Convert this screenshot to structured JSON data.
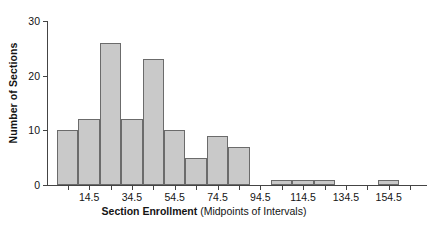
{
  "chart_data": {
    "type": "bar",
    "title": "",
    "subtitle": "",
    "xlabel_bold": "Section Enrollment",
    "xlabel_plain": " (Midpoints of Intervals)",
    "ylabel": "Number of Sections",
    "categories": [
      "4.5",
      "14.5",
      "24.5",
      "34.5",
      "44.5",
      "54.5",
      "64.5",
      "74.5",
      "84.5",
      "94.5",
      "104.5",
      "114.5",
      "124.5",
      "134.5",
      "144.5",
      "154.5",
      "164.5"
    ],
    "values": [
      10,
      12,
      26,
      12,
      23,
      10,
      5,
      9,
      7,
      0,
      1,
      1,
      1,
      0,
      0,
      1,
      0
    ],
    "bar_midpoints": [
      4.5,
      14.5,
      24.5,
      34.5,
      44.5,
      54.5,
      64.5,
      74.5,
      84.5,
      94.5,
      104.5,
      114.5,
      124.5,
      134.5,
      144.5,
      154.5,
      164.5
    ],
    "bar_interval_width": 10,
    "xlim": [
      -0.5,
      169.5
    ],
    "ylim": [
      0,
      30
    ],
    "ytick_values": [
      0,
      10,
      20,
      30
    ],
    "ytick_labels": [
      "0",
      "10",
      "20",
      "30"
    ],
    "xtick_values": [
      4.5,
      14.5,
      24.5,
      34.5,
      44.5,
      54.5,
      64.5,
      74.5,
      84.5,
      94.5,
      104.5,
      114.5,
      124.5,
      134.5,
      144.5,
      154.5,
      164.5
    ],
    "xtick_labels": [
      "",
      "14.5",
      "",
      "34.5",
      "",
      "54.5",
      "",
      "74.5",
      "",
      "94.5",
      "",
      "114.5",
      "",
      "134.5",
      "",
      "154.5",
      ""
    ],
    "grid": false,
    "legend": false,
    "legend_position": "none",
    "bar_fill_color": "#c9c9c9",
    "bar_edge_color": "#6b6b6b",
    "axis_color": "#444444",
    "text_color": "#141414",
    "background_color": "#ffffff"
  },
  "figure": {
    "y_axis_title": "Number of Sections",
    "x_axis_title_bold": "Section Enrollment",
    "x_axis_title_plain": " (Midpoints of Intervals)"
  }
}
